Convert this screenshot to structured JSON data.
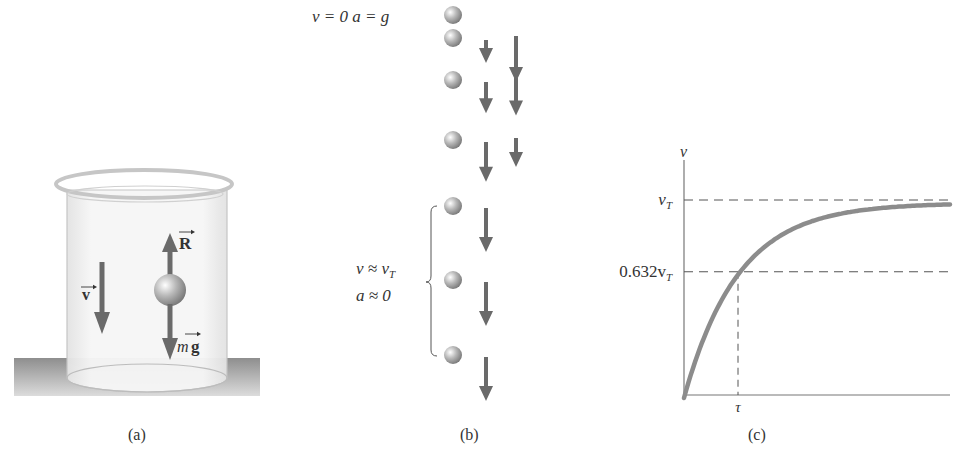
{
  "figure": {
    "panel_labels": {
      "a": "(a)",
      "b": "(b)",
      "c": "(c)"
    },
    "colors": {
      "arrow": "#6a6a6a",
      "curve": "#8c8c8c",
      "ink": "#333333",
      "ground": "#9a9a9a",
      "ball": "#a8a8a8"
    }
  },
  "panel_a": {
    "velocity_label": "v",
    "resistive_force_label": "R",
    "gravity_label_m": "m",
    "gravity_label_g": "g"
  },
  "panel_b": {
    "initial_state_label": "v = 0  a = g",
    "terminal_v_label": "v ≈ v",
    "terminal_v_subscript": "T",
    "terminal_a_label": "a ≈ 0",
    "sequence": [
      {
        "velocity": 0.0,
        "acceleration": null
      },
      {
        "velocity": 0.45,
        "acceleration": 1.0
      },
      {
        "velocity": 0.65,
        "acceleration": 0.75
      },
      {
        "velocity": 0.85,
        "acceleration": 0.5
      },
      {
        "velocity": 0.95,
        "acceleration": 0
      },
      {
        "velocity": 0.95,
        "acceleration": 0
      },
      {
        "velocity": 0.95,
        "acceleration": 0
      }
    ]
  },
  "panel_c": {
    "chart_data": {
      "type": "line",
      "title": "",
      "ylabel": "v",
      "xlabel": "",
      "xtick_labels": [
        "τ"
      ],
      "ytick_labels": [
        "v_T",
        "0.632v_T"
      ],
      "function": "v = v_T (1 - exp(-t/τ))",
      "x_range_in_tau": [
        0,
        5
      ],
      "y_range_in_vT": [
        0,
        1.3
      ],
      "reference_lines": [
        {
          "axis": "y",
          "value_in_vT": 1.0,
          "label": "v_T",
          "style": "dashed"
        },
        {
          "axis": "y",
          "value_in_vT": 0.632,
          "label": "0.632v_T",
          "style": "dashed"
        },
        {
          "axis": "x",
          "value_in_tau": 1.0,
          "label": "τ",
          "style": "dashed"
        }
      ],
      "series": [
        {
          "name": "v(t)",
          "x_in_tau": [
            0,
            0.25,
            0.5,
            0.75,
            1.0,
            1.5,
            2.0,
            2.5,
            3.0,
            3.5,
            4.0,
            4.5,
            5.0
          ],
          "y_in_vT": [
            0,
            0.221,
            0.393,
            0.528,
            0.632,
            0.777,
            0.865,
            0.918,
            0.95,
            0.97,
            0.982,
            0.989,
            0.993
          ]
        }
      ],
      "grid": false,
      "legend": "none"
    },
    "labels": {
      "v_axis": "v",
      "vT": "v",
      "vT_sub": "T",
      "vT632": "0.632v",
      "vT632_sub": "T",
      "tau": "τ"
    }
  }
}
